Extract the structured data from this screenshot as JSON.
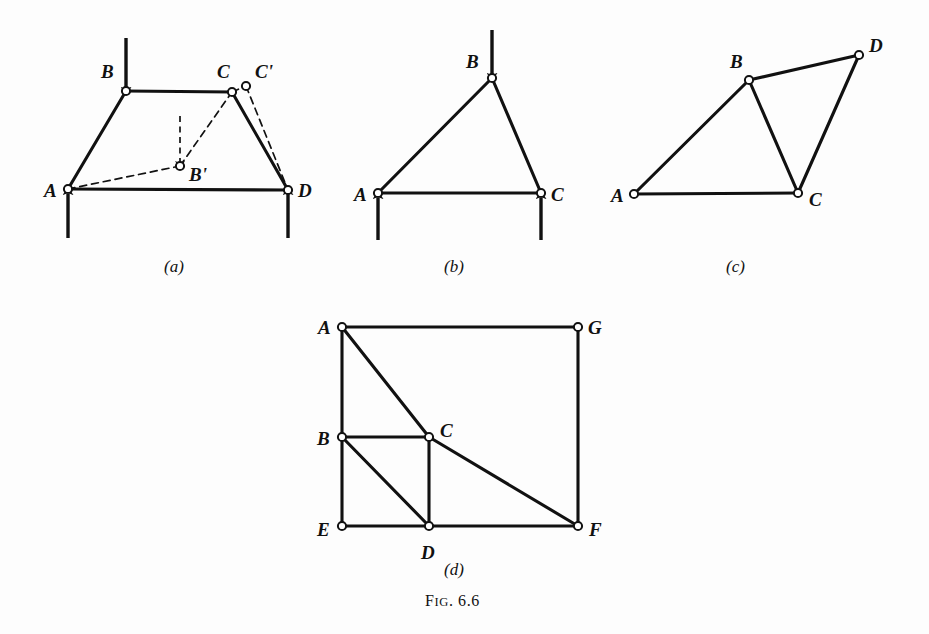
{
  "figure": {
    "caption_prefix": "F",
    "caption_smallcaps": "IG",
    "caption_suffix": ". 6.6",
    "caption_full": "Fig. 6.6",
    "background_color": "#fdfdfd",
    "ink_color": "#111111",
    "node_fill_color": "#ffffff"
  },
  "panels": [
    {
      "id": "a",
      "sub_caption": "(a)",
      "sub_caption_x": 164,
      "sub_caption_y": 258,
      "description": "Trapezoidal four-bar linkage ABCD with loads and displaced position AB'C'D",
      "nodes": [
        {
          "label": "A",
          "x": 68,
          "y": 189,
          "lx": 44,
          "ly": 181,
          "style": "solid"
        },
        {
          "label": "B",
          "x": 126,
          "y": 91,
          "lx": 101,
          "ly": 62,
          "style": "solid"
        },
        {
          "label": "C",
          "x": 232,
          "y": 92,
          "lx": 217,
          "ly": 62,
          "style": "solid"
        },
        {
          "label": "D",
          "x": 288,
          "y": 190,
          "lx": 298,
          "ly": 181,
          "style": "solid"
        },
        {
          "label": "B'",
          "x": 180,
          "y": 166,
          "lx": 189,
          "ly": 165,
          "style": "dashed"
        },
        {
          "label": "C'",
          "x": 246,
          "y": 86,
          "lx": 255,
          "ly": 62,
          "style": "dashed"
        }
      ],
      "solid_members": [
        {
          "from": "A",
          "to": "B"
        },
        {
          "from": "B",
          "to": "C"
        },
        {
          "from": "C",
          "to": "D"
        },
        {
          "from": "A",
          "to": "D"
        }
      ],
      "dashed_members": [
        {
          "from": "A",
          "to": "B'"
        },
        {
          "from": "B'",
          "to": "C"
        },
        {
          "from": "C'",
          "to": "D"
        },
        {
          "from": "C",
          "to": "C'"
        }
      ],
      "arrows": [
        {
          "name": "load-at-B",
          "x1": 126,
          "y1": 38,
          "x2": 126,
          "y2": 88,
          "style": "solid",
          "direction": "down"
        },
        {
          "name": "reaction-at-A",
          "x1": 68,
          "y1": 238,
          "x2": 68,
          "y2": 194,
          "style": "solid",
          "direction": "up"
        },
        {
          "name": "reaction-at-D",
          "x1": 288,
          "y1": 238,
          "x2": 288,
          "y2": 194,
          "style": "solid",
          "direction": "up"
        },
        {
          "name": "virtual-displacement-at-B",
          "x1": 180,
          "y1": 116,
          "x2": 180,
          "y2": 162,
          "style": "dashed",
          "direction": "down"
        }
      ]
    },
    {
      "id": "b",
      "sub_caption": "(b)",
      "sub_caption_x": 444,
      "sub_caption_y": 258,
      "description": "Triangular truss ABC with vertical load at B and reactions at A and C",
      "nodes": [
        {
          "label": "A",
          "x": 378,
          "y": 193,
          "lx": 354,
          "ly": 185,
          "style": "solid"
        },
        {
          "label": "B",
          "x": 492,
          "y": 78,
          "lx": 466,
          "ly": 52,
          "style": "solid"
        },
        {
          "label": "C",
          "x": 541,
          "y": 193,
          "lx": 551,
          "ly": 185,
          "style": "solid"
        }
      ],
      "solid_members": [
        {
          "from": "A",
          "to": "B"
        },
        {
          "from": "B",
          "to": "C"
        },
        {
          "from": "A",
          "to": "C"
        }
      ],
      "dashed_members": [],
      "arrows": [
        {
          "name": "load-at-B",
          "x1": 492,
          "y1": 30,
          "x2": 492,
          "y2": 74,
          "style": "solid",
          "direction": "down"
        },
        {
          "name": "reaction-at-A",
          "x1": 378,
          "y1": 240,
          "x2": 378,
          "y2": 198,
          "style": "solid",
          "direction": "up"
        },
        {
          "name": "reaction-at-C",
          "x1": 541,
          "y1": 240,
          "x2": 541,
          "y2": 198,
          "style": "solid",
          "direction": "up"
        }
      ]
    },
    {
      "id": "c",
      "sub_caption": "(c)",
      "sub_caption_x": 726,
      "sub_caption_y": 258,
      "description": "Two-triangle frame ABC and BCD sharing member BC",
      "nodes": [
        {
          "label": "A",
          "x": 634,
          "y": 194,
          "lx": 611,
          "ly": 186,
          "style": "solid"
        },
        {
          "label": "B",
          "x": 749,
          "y": 80,
          "lx": 730,
          "ly": 52,
          "style": "solid"
        },
        {
          "label": "C",
          "x": 798,
          "y": 193,
          "lx": 809,
          "ly": 190,
          "style": "solid"
        },
        {
          "label": "D",
          "x": 859,
          "y": 55,
          "lx": 869,
          "ly": 36,
          "style": "solid"
        }
      ],
      "solid_members": [
        {
          "from": "A",
          "to": "B"
        },
        {
          "from": "A",
          "to": "C"
        },
        {
          "from": "B",
          "to": "C"
        },
        {
          "from": "B",
          "to": "D"
        },
        {
          "from": "C",
          "to": "D"
        }
      ],
      "dashed_members": [],
      "arrows": []
    },
    {
      "id": "d",
      "sub_caption": "(d)",
      "sub_caption_x": 444,
      "sub_caption_y": 561,
      "description": "Rectangular panel frame AGFE with interior members and braces through B, C and D",
      "nodes": [
        {
          "label": "A",
          "x": 342,
          "y": 327,
          "lx": 318,
          "ly": 318,
          "style": "solid"
        },
        {
          "label": "G",
          "x": 578,
          "y": 327,
          "lx": 588,
          "ly": 318,
          "style": "solid"
        },
        {
          "label": "B",
          "x": 342,
          "y": 437,
          "lx": 317,
          "ly": 429,
          "style": "solid"
        },
        {
          "label": "C",
          "x": 429,
          "y": 437,
          "lx": 440,
          "ly": 421,
          "style": "solid"
        },
        {
          "label": "E",
          "x": 342,
          "y": 526,
          "lx": 317,
          "ly": 520,
          "style": "solid"
        },
        {
          "label": "D",
          "x": 429,
          "y": 526,
          "lx": 421,
          "ly": 543,
          "style": "solid"
        },
        {
          "label": "F",
          "x": 578,
          "y": 526,
          "lx": 589,
          "ly": 520,
          "style": "solid"
        }
      ],
      "solid_members": [
        {
          "from": "A",
          "to": "G"
        },
        {
          "from": "A",
          "to": "B"
        },
        {
          "from": "B",
          "to": "E"
        },
        {
          "from": "E",
          "to": "D"
        },
        {
          "from": "D",
          "to": "F"
        },
        {
          "from": "F",
          "to": "G"
        },
        {
          "from": "A",
          "to": "C"
        },
        {
          "from": "B",
          "to": "C"
        },
        {
          "from": "C",
          "to": "D"
        },
        {
          "from": "B",
          "to": "D"
        },
        {
          "from": "C",
          "to": "F"
        }
      ],
      "dashed_members": [],
      "arrows": []
    }
  ]
}
